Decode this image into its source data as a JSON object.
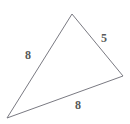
{
  "figure": {
    "type": "triangle-diagram",
    "background_color": "#ffffff",
    "stroke_color": "#7a7a82",
    "stroke_width": 1,
    "label_color": "#595959",
    "vertices": {
      "apex": {
        "x": 72,
        "y": 14
      },
      "right": {
        "x": 123,
        "y": 76
      },
      "bottom_left": {
        "x": 7,
        "y": 118
      }
    },
    "sides": [
      {
        "name": "left-side",
        "label": "8",
        "from": "apex",
        "to": "bottom_left",
        "label_position": {
          "x": 28,
          "y": 55
        }
      },
      {
        "name": "right-side",
        "label": "5",
        "from": "apex",
        "to": "right",
        "label_position": {
          "x": 104,
          "y": 38
        }
      },
      {
        "name": "bottom-side",
        "label": "8",
        "from": "bottom_left",
        "to": "right",
        "label_position": {
          "x": 78,
          "y": 105
        }
      }
    ]
  }
}
